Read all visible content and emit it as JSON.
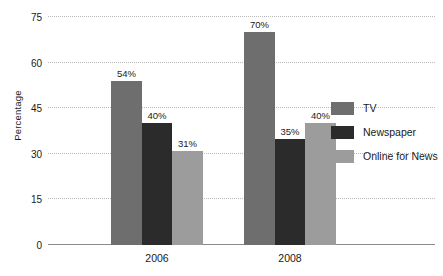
{
  "chart_data": {
    "type": "bar",
    "title": "",
    "xlabel": "",
    "ylabel": "Percentage",
    "categories": [
      "2006",
      "2008"
    ],
    "series": [
      {
        "name": "TV",
        "values": [
          54,
          70
        ],
        "color": "#6e6e6e",
        "labels": [
          "54%",
          "70%"
        ]
      },
      {
        "name": "Newspaper",
        "values": [
          40,
          35
        ],
        "color": "#2b2b2b",
        "labels": [
          "40%",
          "35%"
        ]
      },
      {
        "name": "Online for News",
        "values": [
          31,
          40
        ],
        "color": "#9c9c9c",
        "labels": [
          "31%",
          "40%"
        ]
      }
    ],
    "ylim": [
      0,
      75
    ],
    "yticks": [
      0,
      15,
      30,
      45,
      60,
      75
    ],
    "ytick_labels": [
      "0",
      "15",
      "30",
      "45",
      "60",
      "75"
    ],
    "grid": true,
    "grid_axis": "y",
    "grid_style": "dotted",
    "legend_position": "right"
  },
  "legend": {
    "items": [
      {
        "label": "TV",
        "color": "#6e6e6e"
      },
      {
        "label": "Newspaper",
        "color": "#2b2b2b"
      },
      {
        "label": "Online for News",
        "color": "#9c9c9c"
      }
    ]
  },
  "axes": {
    "y_label": "Percentage"
  }
}
